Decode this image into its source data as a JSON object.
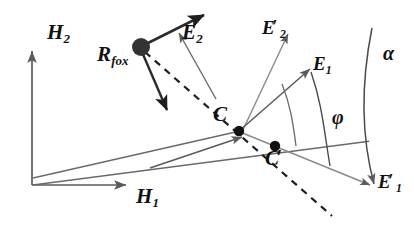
{
  "figure": {
    "type": "vector-geometry-diagram",
    "background_color": "#ffffff",
    "stroke_color": "#4a4a4a",
    "accent_color": "#111111",
    "width": 414,
    "height": 230
  },
  "labels": {
    "h2": {
      "base": "H",
      "sub": "2",
      "prime": ""
    },
    "h1": {
      "base": "H",
      "sub": "1",
      "prime": ""
    },
    "rfox": {
      "base": "R",
      "sub": "fox",
      "prime": ""
    },
    "e2": {
      "base": "E",
      "sub": "2",
      "prime": ""
    },
    "e2_prime": {
      "base": "E",
      "sub": "2",
      "prime": "′"
    },
    "e1": {
      "base": "E",
      "sub": "1",
      "prime": ""
    },
    "e1_prime": {
      "base": "E",
      "sub": "1",
      "prime": "′"
    },
    "c": {
      "base": "C",
      "sub": "",
      "prime": ""
    },
    "c_prime": {
      "base": "C",
      "sub": "",
      "prime": "′"
    },
    "alpha": {
      "base": "α",
      "sub": "",
      "prime": ""
    },
    "phi": {
      "base": "φ",
      "sub": "",
      "prime": ""
    }
  },
  "points": {
    "origin": {
      "x": 32,
      "y": 185,
      "name": "origin"
    },
    "source": {
      "x": 141,
      "y": 47,
      "name": "r-fox-source-dot",
      "radius": 9
    },
    "c": {
      "x": 239,
      "y": 131,
      "name": "c-dot",
      "radius": 5
    },
    "c_prime": {
      "x": 275,
      "y": 146,
      "name": "c-prime-dot",
      "radius": 5
    }
  },
  "vectors": {
    "h2_axis": {
      "from": [
        32,
        185
      ],
      "to": [
        32,
        50
      ],
      "style": "thin-arrow"
    },
    "h1_axis": {
      "from": [
        32,
        185
      ],
      "to": [
        128,
        185
      ],
      "style": "thin-arrow"
    },
    "e2_thick": {
      "from": [
        141,
        47
      ],
      "to": [
        206,
        14
      ],
      "style": "thick-arrow"
    },
    "e2_thin": {
      "from": [
        215,
        95
      ],
      "to": [
        178,
        31
      ],
      "style": "thin-arrow"
    },
    "rfox_down": {
      "from": [
        141,
        47
      ],
      "to": [
        168,
        112
      ],
      "style": "thick-arrow"
    },
    "e2_prime": {
      "from": [
        240,
        132
      ],
      "to": [
        288,
        32
      ],
      "style": "thin-arrow"
    },
    "e1": {
      "from": [
        239,
        131
      ],
      "to": [
        312,
        68
      ],
      "style": "thin-arrow"
    },
    "e1_prime": {
      "from": [
        239,
        131
      ],
      "to": [
        372,
        186
      ],
      "style": "thin-arrow"
    },
    "c_pointer": {
      "from": [
        182,
        158
      ],
      "to": [
        240,
        136
      ],
      "style": "thin-arrow"
    },
    "dashed_axis": {
      "from": [
        141,
        47
      ],
      "to": [
        332,
        216
      ],
      "style": "dashed"
    },
    "ray_origin_c": {
      "from": [
        32,
        185
      ],
      "to": [
        239,
        131
      ],
      "style": "thin"
    },
    "ray_origin_cp": {
      "from": [
        32,
        180
      ],
      "to": [
        340,
        140
      ],
      "style": "thin"
    }
  },
  "arcs": {
    "alpha_arc": {
      "name": "alpha-arc",
      "label": "α"
    },
    "phi_arc": {
      "name": "phi-arc",
      "label": "φ"
    },
    "inner_arc": {
      "name": "inner-angle-arc",
      "label": ""
    }
  }
}
